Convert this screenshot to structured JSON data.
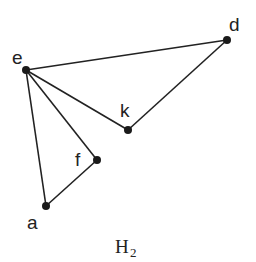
{
  "graph": {
    "caption": "H",
    "caption_subscript": "2",
    "nodes": [
      {
        "id": "e",
        "label": "e"
      },
      {
        "id": "d",
        "label": "d"
      },
      {
        "id": "k",
        "label": "k"
      },
      {
        "id": "f",
        "label": "f"
      },
      {
        "id": "a",
        "label": "a"
      }
    ],
    "edges": [
      [
        "e",
        "d"
      ],
      [
        "d",
        "k"
      ],
      [
        "e",
        "k"
      ],
      [
        "e",
        "f"
      ],
      [
        "f",
        "a"
      ],
      [
        "e",
        "a"
      ]
    ],
    "colors": {
      "line": "#222222",
      "node": "#1a1a1a",
      "background": "#ffffff"
    }
  }
}
